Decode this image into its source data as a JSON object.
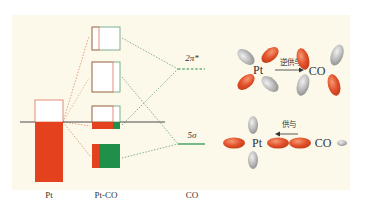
{
  "diagram": {
    "colors": {
      "background_panel": "#fdf9ea",
      "pt_fill": "#e4411f",
      "co_green": "#1f8f49",
      "box_outline_red": "#d9705a",
      "box_outline_green": "#5a9e74",
      "fermi_line": "#4a4a4a",
      "orbital_red": "#e2532c",
      "orbital_gray": "#b8b8b8",
      "dotted_connector_green": "#6a9a78",
      "dotted_connector_red": "#d9886e"
    },
    "columns": {
      "pt": "Pt",
      "pt_co": "Pt-CO",
      "co": "CO"
    },
    "levels": {
      "pi_star": {
        "label": "2π*",
        "style": "dashed"
      },
      "sigma": {
        "label": "5σ",
        "style": "solid"
      }
    },
    "right_panels": {
      "back_donation": {
        "metal": "Pt",
        "ligand": "CO",
        "arrow_label": "逆供与",
        "arrow_direction": "Pt→CO"
      },
      "donation": {
        "metal": "Pt",
        "ligand": "CO",
        "arrow_label": "供与",
        "arrow_direction": "CO→Pt"
      }
    },
    "caption": ""
  }
}
